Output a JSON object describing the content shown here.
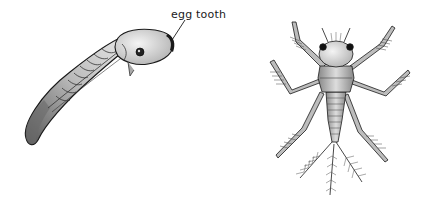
{
  "illustration": {
    "left_figure": {
      "subject": "insect-embryo",
      "label": "egg tooth"
    },
    "right_figure": {
      "subject": "mayfly-nymph"
    }
  },
  "colors": {
    "background": "#ffffff",
    "ink": "#1a1a1a",
    "shade": "#8a8a8a",
    "light": "#d8d8d8"
  }
}
